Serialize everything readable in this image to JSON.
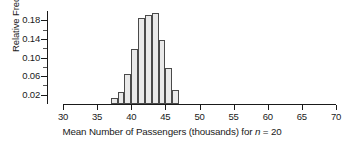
{
  "chart_data": {
    "type": "bar",
    "title": "",
    "subtitle": "",
    "xlabel_parts": {
      "before_italic": "Mean Number of Passengers (thousands) for ",
      "italic": "n",
      "after_italic": " = 20"
    },
    "xlabel": "Mean Number of Passengers (thousands) for n = 20",
    "ylabel": "Relative Frequency",
    "xlim": [
      30,
      70
    ],
    "ylim": [
      0,
      0.2
    ],
    "grid": false,
    "legend": "none",
    "bin_width": 1,
    "x_ticks": [
      30,
      35,
      40,
      45,
      50,
      55,
      60,
      65,
      70
    ],
    "x_tick_labels": [
      "30",
      "35",
      "40",
      "45",
      "50",
      "55",
      "60",
      "65",
      "70"
    ],
    "y_ticks": [
      0.02,
      0.06,
      0.1,
      0.14,
      0.18
    ],
    "y_tick_labels": [
      "0.02",
      "0.06",
      "0.10",
      "0.14",
      "0.18"
    ],
    "y_minor_ticks": [
      0.04,
      0.08,
      0.12,
      0.16
    ],
    "bin_starts": [
      37,
      38,
      39,
      40,
      41,
      42,
      43,
      44,
      45,
      46
    ],
    "bin_ends": [
      38,
      39,
      40,
      41,
      42,
      43,
      44,
      45,
      46,
      47
    ],
    "categories": [
      "37-38",
      "38-39",
      "39-40",
      "40-41",
      "41-42",
      "42-43",
      "43-44",
      "44-45",
      "45-46",
      "46-47"
    ],
    "values": [
      0.013,
      0.026,
      0.065,
      0.119,
      0.184,
      0.191,
      0.195,
      0.138,
      0.078,
      0.03
    ],
    "bar_fill_color": "#e9e9e9",
    "bar_border_color": "#4a4a4a",
    "axis_color": "#1a1a1a",
    "background_color": "#ffffff"
  }
}
